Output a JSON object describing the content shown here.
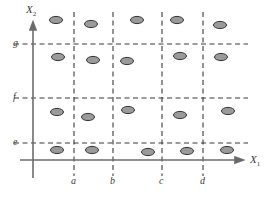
{
  "figure": {
    "title": "",
    "axes": {
      "x_axis_label": "X",
      "x_axis_subscript": "1",
      "y_axis_label": "X",
      "y_axis_subscript": "2"
    },
    "colors": {
      "axis": "#6b6b6b",
      "gridline": "#3a3a3a",
      "marker_fill": "#9a9a9a",
      "marker_stroke": "#333333",
      "text": "#3b3b3b",
      "background": "#ffffff"
    }
  },
  "chart_data": {
    "type": "scatter",
    "title": "",
    "xlabel": "X1",
    "ylabel": "X2",
    "grid": true,
    "legend": null,
    "xlim": [
      0,
      276
    ],
    "ylim": [
      0,
      197
    ],
    "x_tick_labels": [
      "a",
      "b",
      "c",
      "d"
    ],
    "x_tick_positions": [
      74,
      113,
      162,
      203
    ],
    "y_tick_labels": [
      "e",
      "f",
      "g"
    ],
    "y_tick_positions": [
      143,
      98,
      44
    ],
    "x_axis_origin": 33,
    "y_axis_baseline": 160,
    "vertical_gridlines": [
      {
        "label": "a",
        "x": 74
      },
      {
        "label": "b",
        "x": 113
      },
      {
        "label": "c",
        "x": 162
      },
      {
        "label": "d",
        "x": 203
      }
    ],
    "horizontal_gridlines": [
      {
        "label": "g",
        "y": 44
      },
      {
        "label": "f",
        "y": 98
      },
      {
        "label": "e",
        "y": 143
      }
    ],
    "points": [
      {
        "x": 56,
        "y": 20,
        "row": 1,
        "col": 1
      },
      {
        "x": 91,
        "y": 24,
        "row": 1,
        "col": 2
      },
      {
        "x": 137,
        "y": 20,
        "row": 1,
        "col": 3
      },
      {
        "x": 177,
        "y": 20,
        "row": 1,
        "col": 4
      },
      {
        "x": 220,
        "y": 25,
        "row": 1,
        "col": 5
      },
      {
        "x": 58,
        "y": 57,
        "row": 2,
        "col": 1
      },
      {
        "x": 93,
        "y": 60,
        "row": 2,
        "col": 2
      },
      {
        "x": 127,
        "y": 61,
        "row": 2,
        "col": 3
      },
      {
        "x": 180,
        "y": 56,
        "row": 2,
        "col": 4
      },
      {
        "x": 221,
        "y": 57,
        "row": 2,
        "col": 5
      },
      {
        "x": 57,
        "y": 112,
        "row": 3,
        "col": 1
      },
      {
        "x": 88,
        "y": 117,
        "row": 3,
        "col": 2
      },
      {
        "x": 128,
        "y": 110,
        "row": 3,
        "col": 3
      },
      {
        "x": 180,
        "y": 115,
        "row": 3,
        "col": 4
      },
      {
        "x": 228,
        "y": 111,
        "row": 3,
        "col": 5
      },
      {
        "x": 57,
        "y": 150,
        "row": 4,
        "col": 1
      },
      {
        "x": 92,
        "y": 150,
        "row": 4,
        "col": 2
      },
      {
        "x": 148,
        "y": 152,
        "row": 4,
        "col": 3
      },
      {
        "x": 187,
        "y": 151,
        "row": 4,
        "col": 4
      },
      {
        "x": 227,
        "y": 150,
        "row": 4,
        "col": 5
      }
    ],
    "marker": {
      "shape": "ellipse",
      "rx": 6.5,
      "ry": 3.6
    }
  }
}
